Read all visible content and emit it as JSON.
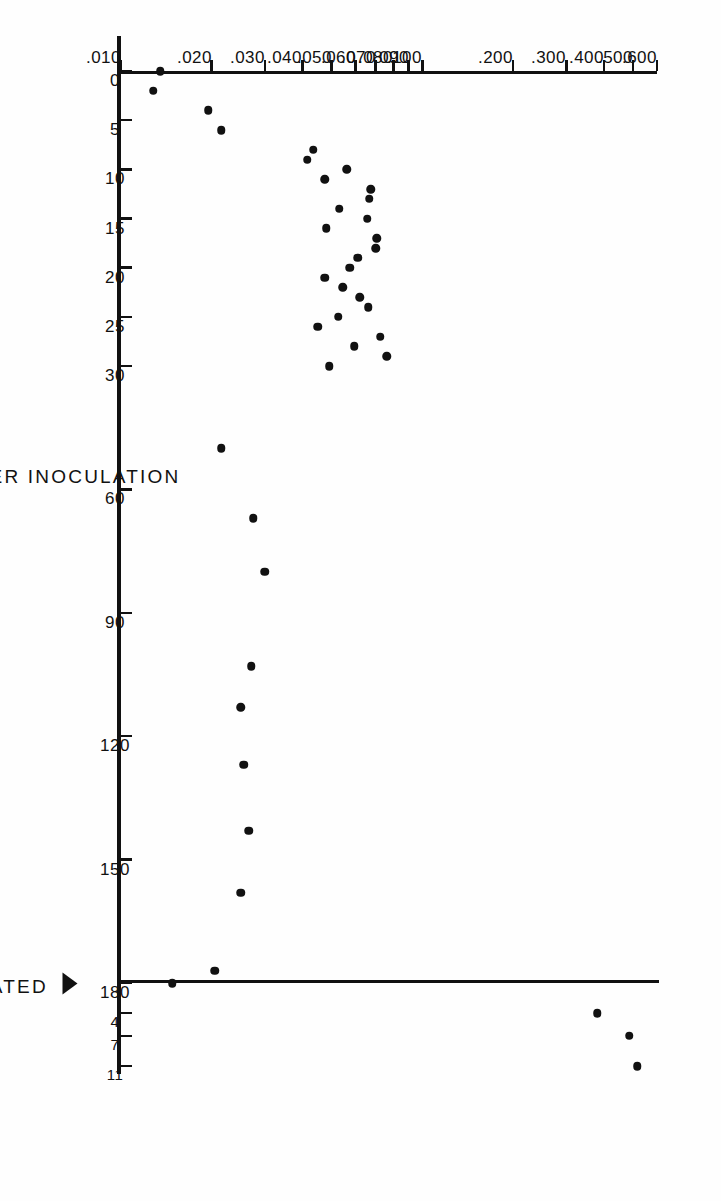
{
  "figure": {
    "background_color": "#ffffff",
    "ink_color": "#111111",
    "rotation_degrees": 90,
    "orientation_note": "printed sideways on page"
  },
  "annotations": {
    "reinoculated_label": "REINOCULATED",
    "reinoculated_day": 180,
    "arrow_icon": "left-arrow-icon"
  },
  "chart_data": {
    "type": "scatter",
    "title": "",
    "xlabel": "DAYS AFTER INOCULATION",
    "ylabel": "ELISA O.D.",
    "yscale": "log",
    "grid": false,
    "legend": null,
    "xlim": [
      0,
      195
    ],
    "ylim": [
      0.01,
      0.6
    ],
    "xticks": [
      0,
      5,
      10,
      15,
      20,
      25,
      30,
      60,
      90,
      120,
      150,
      180
    ],
    "xtick_labels": [
      "0",
      "5",
      "10",
      "15",
      "20",
      "25",
      "30",
      "60",
      "90",
      "120",
      "150",
      "180"
    ],
    "post_reinoculation_xticks": [
      184,
      187,
      191
    ],
    "post_reinoculation_xtick_labels": [
      "4",
      "7",
      "11"
    ],
    "yticks": [
      0.01,
      0.02,
      0.03,
      0.04,
      0.05,
      0.06,
      0.07,
      0.08,
      0.09,
      0.1,
      0.2,
      0.3,
      0.4,
      0.5,
      0.6
    ],
    "ytick_labels": [
      ".010",
      ".020",
      ".030",
      ".040",
      ".050",
      ".060",
      ".070",
      ".080",
      ".090",
      ".100",
      ".200",
      ".300",
      ".400",
      ".500",
      ".600"
    ],
    "series": [
      {
        "name": "ELISA O.D. readings",
        "marker": "filled-circle",
        "color": "#111111",
        "points": [
          [
            0,
            0.0135
          ],
          [
            2,
            0.0128
          ],
          [
            4,
            0.0195
          ],
          [
            6,
            0.0215
          ],
          [
            8,
            0.0435
          ],
          [
            9,
            0.0415
          ],
          [
            10,
            0.056
          ],
          [
            11,
            0.0475
          ],
          [
            12,
            0.0675
          ],
          [
            13,
            0.0665
          ],
          [
            14,
            0.053
          ],
          [
            15,
            0.0655
          ],
          [
            16,
            0.048
          ],
          [
            17,
            0.0705
          ],
          [
            18,
            0.07
          ],
          [
            19,
            0.061
          ],
          [
            20,
            0.0575
          ],
          [
            21,
            0.0475
          ],
          [
            22,
            0.0545
          ],
          [
            23,
            0.062
          ],
          [
            24,
            0.066
          ],
          [
            25,
            0.0525
          ],
          [
            26,
            0.045
          ],
          [
            27,
            0.0725
          ],
          [
            28,
            0.0595
          ],
          [
            29,
            0.076
          ],
          [
            30,
            0.049
          ],
          [
            50,
            0.0215
          ],
          [
            67,
            0.0275
          ],
          [
            80,
            0.03
          ],
          [
            103,
            0.027
          ],
          [
            113,
            0.025
          ],
          [
            127,
            0.0255
          ],
          [
            143,
            0.0265
          ],
          [
            158,
            0.025
          ],
          [
            177,
            0.0205
          ],
          [
            180,
            0.0148
          ],
          [
            184,
            0.38
          ],
          [
            187,
            0.485
          ],
          [
            191,
            0.515
          ]
        ]
      }
    ]
  }
}
